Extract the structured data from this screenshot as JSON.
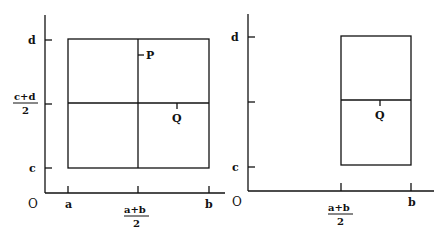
{
  "diagram": {
    "left_panel": {
      "origin_label": "O",
      "x_ticks": {
        "a": "a",
        "mid_num": "a+b",
        "mid_den": "2",
        "b": "b"
      },
      "y_ticks": {
        "d": "d",
        "mid_num": "c+d",
        "mid_den": "2",
        "c": "c"
      },
      "point_p": "P",
      "point_q": "Q"
    },
    "right_panel": {
      "origin_label": "O",
      "x_ticks": {
        "mid_num": "a+b",
        "mid_den": "2",
        "b": "b"
      },
      "y_ticks": {
        "d": "d",
        "c": "c"
      },
      "point_q": "Q"
    }
  }
}
